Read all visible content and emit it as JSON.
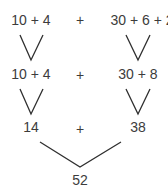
{
  "diagram": {
    "type": "addition-decomposition-tree",
    "row1": {
      "left": "10 + 4",
      "operator": "+",
      "right": "30 + 6 + 2"
    },
    "row2": {
      "left": "10 + 4",
      "operator": "+",
      "right": "30 + 8"
    },
    "row3": {
      "left": "14",
      "operator": "+",
      "right": "38"
    },
    "result": "52",
    "colors": {
      "text": "#3c3c3c",
      "lines": "#2f2f2f",
      "background": "#ffffff"
    }
  }
}
